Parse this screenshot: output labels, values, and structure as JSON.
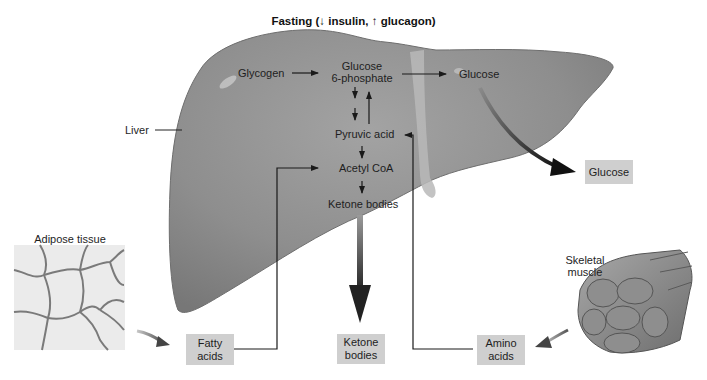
{
  "title": "Fasting (↓ insulin, ↑ glucagon)",
  "organ_labels": {
    "liver": "Liver",
    "adipose": "Adipose tissue",
    "muscle_line1": "Skeletal",
    "muscle_line2": "muscle"
  },
  "pathway": {
    "glycogen": "Glycogen",
    "g6p_line1": "Glucose",
    "g6p_line2": "6-phosphate",
    "glucose_in_liver": "Glucose",
    "pyruvic_acid": "Pyruvic acid",
    "acetyl_coa": "Acetyl CoA",
    "ketone_bodies": "Ketone bodies"
  },
  "boxes": {
    "glucose_out": "Glucose",
    "fatty_acids_line1": "Fatty",
    "fatty_acids_line2": "acids",
    "ketone_out_line1": "Ketone",
    "ketone_out_line2": "bodies",
    "amino_line1": "Amino",
    "amino_line2": "acids"
  },
  "colors": {
    "liver_fill": "#8c8c8c",
    "box_fill": "#cfcfcf",
    "adipose_bg": "#e9e9e9",
    "arrow": "#1a1a1a"
  }
}
